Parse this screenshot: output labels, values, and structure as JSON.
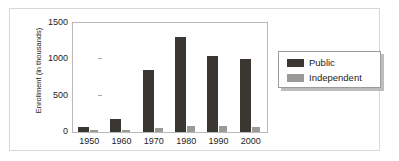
{
  "chart_data": {
    "type": "bar",
    "title": "",
    "xlabel": "",
    "ylabel": "Enrollment (in thousands)",
    "categories": [
      "1950",
      "1960",
      "1970",
      "1980",
      "1990",
      "2000"
    ],
    "series": [
      {
        "name": "Public",
        "color": "#3a3632",
        "values": [
          70,
          175,
          850,
          1310,
          1040,
          1000
        ]
      },
      {
        "name": "Independent",
        "color": "#9a9a98",
        "values": [
          10,
          20,
          50,
          85,
          85,
          70
        ]
      }
    ],
    "ylim": [
      0,
      1500
    ],
    "yticks": [
      0,
      500,
      1000,
      1500
    ],
    "ytick_labels": [
      "0",
      "500",
      "1000",
      "1500"
    ],
    "grid": false,
    "legend_position": "right"
  },
  "legend": {
    "entries": [
      {
        "label": "Public",
        "swatch": "public-swatch"
      },
      {
        "label": "Independent",
        "swatch": "independent-swatch"
      }
    ]
  },
  "colors": {
    "public": "#3a3632",
    "independent": "#9a9a98",
    "frame": "#d8d8d8",
    "axis": "#b9b9b9",
    "text": "#1d1d1d"
  }
}
